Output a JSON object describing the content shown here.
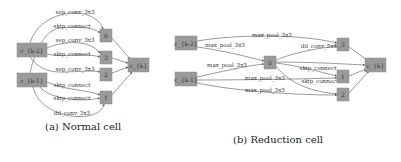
{
  "figures": [
    {
      "id": "normal",
      "caption": "(a) Normal cell",
      "inputs": [
        {
          "id": "ck2",
          "label": "c_{k-2}"
        },
        {
          "id": "ck1",
          "label": "c_{k-1}"
        }
      ],
      "intermediate_nodes": [
        "0",
        "3",
        "2",
        "1"
      ],
      "output": {
        "id": "ck",
        "label": "c_{k}"
      },
      "edges": [
        {
          "from": "c_{k-2}",
          "to": "0",
          "op": "sep_conv_3x3"
        },
        {
          "from": "c_{k-1}",
          "to": "0",
          "op": "skip_connect"
        },
        {
          "from": "c_{k-2}",
          "to": "3",
          "op": "sep_conv_3x3"
        },
        {
          "from": "c_{k-2}",
          "to": "3",
          "op": "skip_connect"
        },
        {
          "from": "c_{k-1}",
          "to": "2",
          "op": "sep_conv_3x3"
        },
        {
          "from": "c_{k-1}",
          "to": "1",
          "op": "skip_connect"
        },
        {
          "from": "c_{k-1}",
          "to": "1",
          "op": "skip_connect"
        },
        {
          "from": "c_{k-1}",
          "to": "1",
          "op": "dil_conv_3x3"
        }
      ],
      "edge_labels": [
        "sep_conv_3x3",
        "skip_connect",
        "sep_conv_3x3",
        "skip_connect",
        "sep_conv_3x3",
        "skip_connect",
        "skip_connect",
        "dil_conv_3x3"
      ]
    },
    {
      "id": "reduction",
      "caption": "(b) Reduction cell",
      "inputs": [
        {
          "id": "ck2",
          "label": "c_{k-2}"
        },
        {
          "id": "ck1",
          "label": "c_{k-1}"
        }
      ],
      "intermediate_nodes": [
        "0",
        "3",
        "1",
        "2"
      ],
      "output": {
        "id": "ck",
        "label": "c_{k}"
      },
      "edges": [
        {
          "from": "c_{k-2}",
          "to": "3",
          "op": "max_pool_3x3"
        },
        {
          "from": "c_{k-2}",
          "to": "0",
          "op": "max_pool_3x3"
        },
        {
          "from": "c_{k-1}",
          "to": "0",
          "op": "max_pool_3x3"
        },
        {
          "from": "0",
          "to": "3",
          "op": "dil_conv_5x5"
        },
        {
          "from": "0",
          "to": "1",
          "op": "skip_connect"
        },
        {
          "from": "0",
          "to": "2",
          "op": "skip_connect"
        },
        {
          "from": "c_{k-1}",
          "to": "1",
          "op": "max_pool_3x3"
        },
        {
          "from": "c_{k-1}",
          "to": "2",
          "op": "max_pool_3x3"
        }
      ],
      "edge_labels": [
        "max_pool_3x3",
        "max_pool_3x3",
        "dil_conv_5x5",
        "max_pool_3x3",
        "skip_connect",
        "max_pool_3x3",
        "skip_connect",
        "max_pool_3x3"
      ]
    }
  ],
  "colors": {
    "node_fill": "#9a9a9a",
    "edge": "#555555",
    "text": "#333333",
    "background": "#ffffff"
  }
}
